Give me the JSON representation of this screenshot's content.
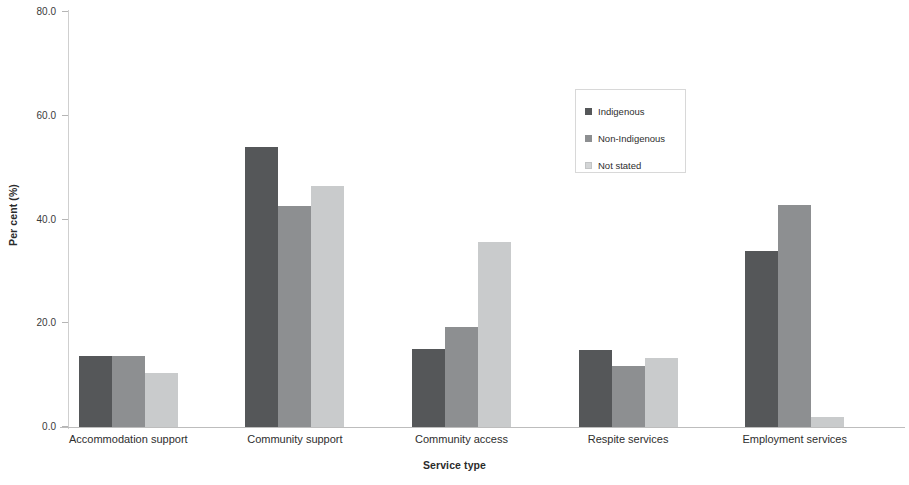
{
  "chart_data": {
    "type": "bar",
    "title": "",
    "xlabel": "Service type",
    "ylabel": "Per cent (%)",
    "ylim": [
      0,
      80
    ],
    "yticks": [
      "0.0",
      "20.0",
      "40.0",
      "60.0",
      "80.0"
    ],
    "ytick_values": [
      0,
      20,
      40,
      60,
      80
    ],
    "grid": false,
    "legend_position": "upper center",
    "categories": [
      "Accommodation support",
      "Community support",
      "Community access",
      "Respite services",
      "Employment services"
    ],
    "series": [
      {
        "name": "Indigenous",
        "color": "#555759",
        "values": [
          13.7,
          54.0,
          15.0,
          14.8,
          34.0
        ]
      },
      {
        "name": "Non-Indigenous",
        "color": "#8d8f91",
        "values": [
          13.7,
          42.6,
          19.2,
          11.8,
          42.8
        ]
      },
      {
        "name": "Not stated",
        "color": "#c9cbcc",
        "values": [
          10.4,
          46.4,
          35.7,
          13.4,
          2.0
        ]
      }
    ]
  },
  "axes": {
    "y_title": "Per cent (%)",
    "x_title": "Service type"
  },
  "legend": {
    "items": [
      {
        "label": "Indigenous"
      },
      {
        "label": "Non-Indigenous"
      },
      {
        "label": "Not stated"
      }
    ]
  }
}
